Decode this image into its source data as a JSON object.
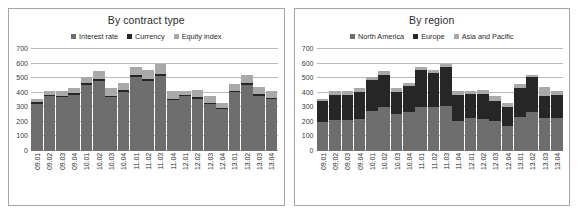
{
  "figure": {
    "background": "#ffffff",
    "border_color": "#a6a6a6"
  },
  "chart_data": [
    {
      "type": "bar",
      "subtype": "stacked",
      "title": "By contract type",
      "xlabel": "",
      "ylabel": "",
      "ylim": [
        0,
        700
      ],
      "yticks": [
        0,
        100,
        200,
        300,
        400,
        500,
        600,
        700
      ],
      "ytick_labels": [
        "0",
        "100",
        "200",
        "300",
        "400",
        "500",
        "600",
        "700"
      ],
      "grid": true,
      "legend_position": "top-center",
      "categories": [
        "09.01",
        "09.02",
        "09.03",
        "09.04",
        "10.01",
        "10.02",
        "10.03",
        "10.04",
        "11.01",
        "11.02",
        "11.03",
        "11.04",
        "12.01",
        "12.02",
        "12.03",
        "12.04",
        "13.01",
        "13.02",
        "13.03",
        "13.04"
      ],
      "series": [
        {
          "name": "Interest rate",
          "color": "#6e6e6e",
          "values": [
            325,
            378,
            370,
            385,
            452,
            483,
            372,
            408,
            508,
            480,
            515,
            348,
            375,
            360,
            320,
            285,
            405,
            452,
            378,
            355
          ]
        },
        {
          "name": "Currency",
          "color": "#262626",
          "values": [
            10,
            8,
            8,
            10,
            12,
            12,
            8,
            10,
            12,
            12,
            12,
            8,
            8,
            8,
            8,
            8,
            10,
            12,
            10,
            10
          ]
        },
        {
          "name": "Equity index",
          "color": "#a9a9a9",
          "values": [
            25,
            29,
            37,
            40,
            46,
            55,
            50,
            52,
            55,
            63,
            68,
            59,
            32,
            52,
            47,
            37,
            45,
            56,
            52,
            50
          ]
        }
      ],
      "totals": [
        360,
        415,
        415,
        435,
        510,
        550,
        430,
        470,
        575,
        555,
        595,
        415,
        415,
        420,
        375,
        330,
        460,
        520,
        440,
        415
      ]
    },
    {
      "type": "bar",
      "subtype": "stacked",
      "title": "By region",
      "xlabel": "",
      "ylabel": "",
      "ylim": [
        0,
        700
      ],
      "yticks": [
        0,
        100,
        200,
        300,
        400,
        500,
        600,
        700
      ],
      "ytick_labels": [
        "0",
        "100",
        "200",
        "300",
        "400",
        "500",
        "600",
        "700"
      ],
      "grid": true,
      "legend_position": "top-center",
      "categories": [
        "09.01",
        "09.02",
        "09.03",
        "09.04",
        "10.01",
        "10.02",
        "10.03",
        "10.04",
        "11.01",
        "11.02",
        "11.03",
        "11.04",
        "12.01",
        "12.02",
        "12.03",
        "12.04",
        "13.01",
        "13.02",
        "13.03",
        "13.04"
      ],
      "series": [
        {
          "name": "North America",
          "color": "#6e6e6e",
          "values": [
            200,
            215,
            215,
            222,
            272,
            300,
            255,
            265,
            300,
            300,
            310,
            205,
            225,
            222,
            205,
            172,
            235,
            268,
            225,
            228
          ]
        },
        {
          "name": "Europe",
          "color": "#262626",
          "values": [
            140,
            172,
            168,
            180,
            218,
            220,
            150,
            180,
            255,
            235,
            265,
            180,
            165,
            172,
            140,
            130,
            195,
            240,
            155,
            155
          ]
        },
        {
          "name": "Asia and Pacific",
          "color": "#a9a9a9",
          "values": [
            20,
            28,
            32,
            33,
            20,
            30,
            25,
            25,
            20,
            20,
            20,
            30,
            25,
            26,
            30,
            28,
            30,
            12,
            60,
            32
          ]
        }
      ],
      "totals": [
        360,
        415,
        415,
        435,
        510,
        550,
        430,
        470,
        575,
        555,
        595,
        415,
        415,
        420,
        375,
        330,
        460,
        520,
        440,
        415
      ]
    }
  ]
}
